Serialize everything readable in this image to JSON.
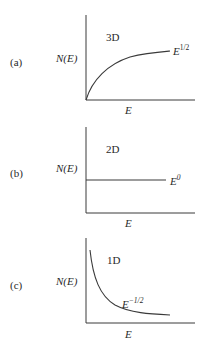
{
  "panels": [
    {
      "id": "a",
      "label": "(a)",
      "ylabel": "N(E)",
      "xlabel": "E",
      "dimension": "3D",
      "curve_label_base": "E",
      "curve_label_exp": "1/2",
      "shape": "sqrt"
    },
    {
      "id": "b",
      "label": "(b)",
      "ylabel": "N(E)",
      "xlabel": "E",
      "dimension": "2D",
      "curve_label_base": "E",
      "curve_label_exp": "0",
      "shape": "constant"
    },
    {
      "id": "c",
      "label": "(c)",
      "ylabel": "N(E)",
      "xlabel": "E",
      "dimension": "1D",
      "curve_label_base": "E",
      "curve_label_exp": "−1/2",
      "shape": "inverse-sqrt"
    }
  ],
  "colors": {
    "line": "#3a3a3a",
    "text": "#2a2a2a"
  }
}
